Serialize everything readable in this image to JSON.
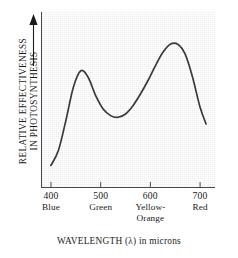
{
  "figure": {
    "y_axis": {
      "label_lines": [
        "RELATIVE EFFECTIVENESS",
        "IN PHOTOSYNTHESIS"
      ],
      "arrow": "up-arrow-icon",
      "has_tick_labels": false
    },
    "x_axis": {
      "title": "WAVELENGTH  (λ) in microns",
      "ticks": [
        {
          "value": "400",
          "name": "Blue"
        },
        {
          "value": "500",
          "name": "Green"
        },
        {
          "value": "600",
          "name": "Yellow-\nOrange"
        },
        {
          "value": "700",
          "name": "Red"
        }
      ]
    },
    "colors": {
      "plot_background": "#ededed",
      "axis_line": "#4a4a4a",
      "curve": "#3a3a3a",
      "text": "#1a1a1a",
      "page_background": "#ffffff"
    }
  },
  "chart_data": {
    "type": "line",
    "title": "",
    "subtitle": "",
    "xlabel": "WAVELENGTH  (λ) in microns",
    "ylabel": "RELATIVE EFFECTIVENESS IN PHOTOSYNTHESIS",
    "xlim": [
      380,
      730
    ],
    "ylim": [
      0,
      100
    ],
    "grid": false,
    "legend": "none",
    "xtick_values": [
      400,
      500,
      600,
      700
    ],
    "xtick_labels": [
      "400",
      "500",
      "600",
      "700"
    ],
    "xtick_color_names": [
      "Blue",
      "Green",
      "Yellow-Orange",
      "Red"
    ],
    "ytick_values": [],
    "ytick_labels": [],
    "annotations": [
      {
        "label": "blue peak",
        "x": 460,
        "y": 70
      },
      {
        "label": "green trough",
        "x": 530,
        "y": 43
      },
      {
        "label": "red peak",
        "x": 650,
        "y": 86
      }
    ],
    "series": [
      {
        "name": "Relative effectiveness in photosynthesis",
        "x": [
          400,
          415,
          430,
          445,
          460,
          475,
          490,
          505,
          520,
          535,
          550,
          565,
          580,
          595,
          610,
          625,
          640,
          655,
          670,
          685,
          700,
          712
        ],
        "values": [
          13,
          22,
          40,
          60,
          70,
          66,
          55,
          47,
          43,
          42,
          44,
          49,
          56,
          64,
          73,
          81,
          86,
          86,
          80,
          66,
          48,
          38
        ]
      }
    ]
  }
}
